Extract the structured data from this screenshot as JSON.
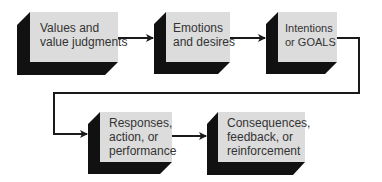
{
  "diagram": {
    "type": "flowchart",
    "colors": {
      "face": "#dcdcdc",
      "shadow": "#111111",
      "connector": "#1a1a1a",
      "text": "#333333"
    },
    "nodes": [
      {
        "id": "values",
        "lines": [
          "Values and",
          "value judgments"
        ]
      },
      {
        "id": "emotions",
        "lines": [
          "Emotions",
          "and desires"
        ]
      },
      {
        "id": "intentions",
        "lines": [
          "Intentions",
          "or GOALS"
        ]
      },
      {
        "id": "responses",
        "lines": [
          "Responses,",
          "action, or",
          "performance"
        ]
      },
      {
        "id": "consequences",
        "lines": [
          "Consequences,",
          "feedback, or",
          "reinforcement"
        ]
      }
    ],
    "edges": [
      {
        "from": "values",
        "to": "emotions"
      },
      {
        "from": "emotions",
        "to": "intentions"
      },
      {
        "from": "intentions",
        "to": "responses"
      },
      {
        "from": "responses",
        "to": "consequences"
      }
    ]
  }
}
